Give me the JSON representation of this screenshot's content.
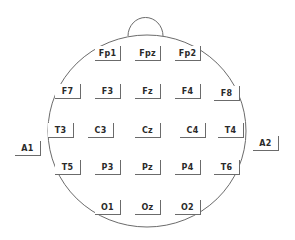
{
  "diagram": {
    "type": "eeg-10-20-electrode-map",
    "outline_color": "#6b6b6b",
    "electrodes": [
      {
        "label": "Fp1",
        "x": 95,
        "y": 46
      },
      {
        "label": "Fpz",
        "x": 135,
        "y": 46
      },
      {
        "label": "Fp2",
        "x": 175,
        "y": 46
      },
      {
        "label": "F7",
        "x": 55,
        "y": 84
      },
      {
        "label": "F3",
        "x": 95,
        "y": 84
      },
      {
        "label": "Fz",
        "x": 135,
        "y": 84
      },
      {
        "label": "F4",
        "x": 175,
        "y": 84
      },
      {
        "label": "F8",
        "x": 214,
        "y": 86
      },
      {
        "label": "A1",
        "x": 15,
        "y": 141
      },
      {
        "label": "T3",
        "x": 48,
        "y": 123
      },
      {
        "label": "C3",
        "x": 88,
        "y": 123
      },
      {
        "label": "Cz",
        "x": 135,
        "y": 123
      },
      {
        "label": "C4",
        "x": 180,
        "y": 123
      },
      {
        "label": "T4",
        "x": 218,
        "y": 123
      },
      {
        "label": "A2",
        "x": 253,
        "y": 136
      },
      {
        "label": "T5",
        "x": 55,
        "y": 160
      },
      {
        "label": "P3",
        "x": 95,
        "y": 160
      },
      {
        "label": "Pz",
        "x": 135,
        "y": 160
      },
      {
        "label": "P4",
        "x": 175,
        "y": 160
      },
      {
        "label": "T6",
        "x": 214,
        "y": 160
      },
      {
        "label": "O1",
        "x": 95,
        "y": 200
      },
      {
        "label": "Oz",
        "x": 135,
        "y": 200
      },
      {
        "label": "O2",
        "x": 175,
        "y": 200
      }
    ]
  }
}
